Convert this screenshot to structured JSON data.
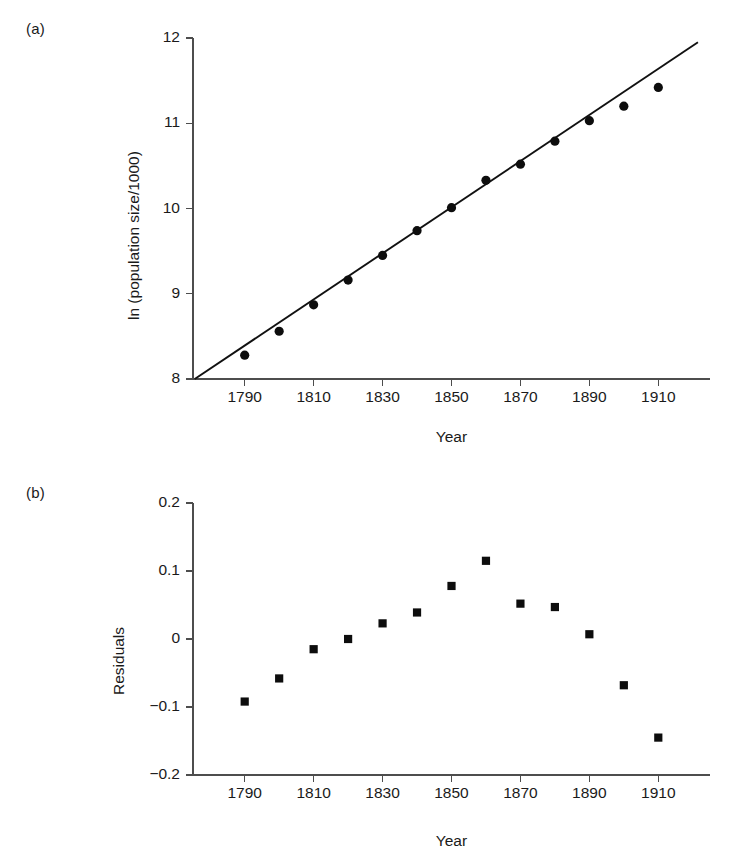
{
  "figure": {
    "panel_a_label": "(a)",
    "panel_b_label": "(b)"
  },
  "chart_data": [
    {
      "type": "scatter",
      "panel": "(a)",
      "title": "",
      "xlabel": "Year",
      "ylabel": "ln (population size/1000)",
      "xlim": [
        1775,
        1925
      ],
      "ylim": [
        8,
        12
      ],
      "xticks": [
        1790,
        1810,
        1830,
        1850,
        1870,
        1890,
        1910
      ],
      "xticklabels": [
        "1790",
        "1810",
        "1830",
        "1850",
        "1870",
        "1890",
        "1910"
      ],
      "yticks": [
        8,
        9,
        10,
        11,
        12
      ],
      "yticklabels": [
        "8",
        "9",
        "10",
        "11",
        "12"
      ],
      "grid": false,
      "legend": null,
      "x": [
        1790,
        1800,
        1810,
        1820,
        1830,
        1840,
        1850,
        1860,
        1870,
        1880,
        1890,
        1900,
        1910
      ],
      "y": [
        8.28,
        8.56,
        8.87,
        9.16,
        9.45,
        9.74,
        10.01,
        10.33,
        10.52,
        10.79,
        11.03,
        11.2,
        11.42
      ],
      "series": [
        {
          "name": "ln(population size/1000)",
          "marker": "filled-circle",
          "values": [
            8.28,
            8.56,
            8.87,
            9.16,
            9.45,
            9.74,
            10.01,
            10.33,
            10.52,
            10.79,
            11.03,
            11.2,
            11.42
          ]
        }
      ],
      "fit_line": {
        "name": "least-squares regression line",
        "x": [
          1775.5,
          1921.5
        ],
        "y": [
          8.0,
          11.95
        ]
      }
    },
    {
      "type": "scatter",
      "panel": "(b)",
      "title": "",
      "xlabel": "Year",
      "ylabel": "Residuals",
      "xlim": [
        1775,
        1925
      ],
      "ylim": [
        -0.2,
        0.2
      ],
      "xticks": [
        1790,
        1810,
        1830,
        1850,
        1870,
        1890,
        1910
      ],
      "xticklabels": [
        "1790",
        "1810",
        "1830",
        "1850",
        "1870",
        "1890",
        "1910"
      ],
      "yticks": [
        -0.2,
        -0.1,
        0,
        0.1,
        0.2
      ],
      "yticklabels": [
        "-0.2",
        "-0.1",
        "0",
        "0.1",
        "0.2"
      ],
      "grid": false,
      "legend": null,
      "x": [
        1790,
        1800,
        1810,
        1820,
        1830,
        1840,
        1850,
        1860,
        1870,
        1880,
        1890,
        1900,
        1910
      ],
      "y": [
        -0.092,
        -0.058,
        -0.015,
        0.0,
        0.023,
        0.039,
        0.078,
        0.115,
        0.052,
        0.047,
        0.007,
        -0.068,
        -0.145
      ],
      "series": [
        {
          "name": "Residuals",
          "marker": "filled-square",
          "values": [
            -0.092,
            -0.058,
            -0.015,
            0.0,
            0.023,
            0.039,
            0.078,
            0.115,
            0.052,
            0.047,
            0.007,
            -0.068,
            -0.145
          ]
        }
      ]
    }
  ]
}
